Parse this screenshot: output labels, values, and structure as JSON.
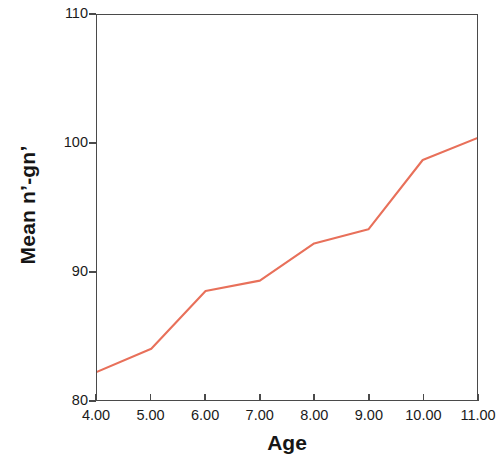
{
  "chart_data": {
    "type": "line",
    "title": "",
    "xlabel": "Age",
    "ylabel": "Mean n’-gn’",
    "x": [
      4,
      5,
      6,
      7,
      8,
      9,
      10,
      11
    ],
    "values": [
      82.2,
      84.0,
      88.5,
      89.3,
      92.2,
      93.3,
      98.7,
      100.4
    ],
    "series": [
      {
        "name": "Mean n’-gn’",
        "color": "#E8705A",
        "values": [
          82.2,
          84.0,
          88.5,
          89.3,
          92.2,
          93.3,
          98.7,
          100.4
        ]
      }
    ],
    "xlim": [
      4,
      11
    ],
    "ylim": [
      80,
      110
    ],
    "xticks": [
      4,
      5,
      6,
      7,
      8,
      9,
      10,
      11
    ],
    "xtick_labels": [
      "4.00",
      "5.00",
      "6.00",
      "7.00",
      "8.00",
      "9.00",
      "10.00",
      "11.00"
    ],
    "yticks": [
      80,
      90,
      100,
      110
    ],
    "ytick_labels": [
      "80",
      "90",
      "100",
      "110"
    ],
    "grid": false,
    "legend": false,
    "frame": "box",
    "line_color": "#E8705A",
    "axis_color": "#4A4A4A",
    "background": "#FFFFFF"
  },
  "axes": {
    "y_title": "Mean n’-gn’",
    "x_title": "Age"
  }
}
